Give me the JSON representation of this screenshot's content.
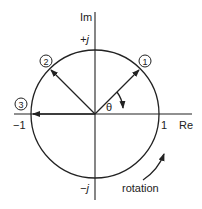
{
  "diagram": {
    "axes": {
      "imag_label": "Im",
      "real_label": "Re",
      "plus_j": "+j",
      "minus_j": "−j",
      "minus_one": "−1",
      "one": "1"
    },
    "phasors": [
      {
        "label": "1",
        "angle_deg": 45
      },
      {
        "label": "2",
        "angle_deg": 135
      },
      {
        "label": "3",
        "angle_deg": 180
      }
    ],
    "angle_label": "θ",
    "rotation_label": "rotation",
    "colors": {
      "stroke": "#222222",
      "background": "#ffffff"
    }
  }
}
